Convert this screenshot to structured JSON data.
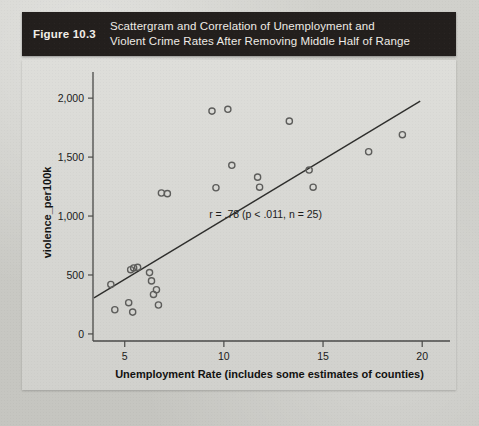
{
  "figure": {
    "number": "Figure 10.3",
    "title_line1": "Scattergram and Correlation of Unemployment and",
    "title_line2": "Violent Crime Rates After Removing Middle Half of Range",
    "bar_color": "#231f1d",
    "text_color": "#efece6"
  },
  "chart_data": {
    "type": "scatter",
    "title": "",
    "xlabel": "Unemployment Rate (includes some estimates of counties)",
    "ylabel": "violence_per100k",
    "xlim": [
      3.4,
      21.2
    ],
    "ylim": [
      -60,
      2120
    ],
    "xticks": [
      5,
      10,
      15,
      20
    ],
    "xticklabels": [
      "5",
      "10",
      "15",
      "20"
    ],
    "yticks": [
      0,
      500,
      1000,
      1500,
      2000
    ],
    "yticklabels": [
      "0",
      "500",
      "1,000",
      "1,500",
      "2,000"
    ],
    "grid": false,
    "legend": null,
    "marker": "open-circle",
    "marker_color": "#5d5d5b",
    "points": [
      {
        "x": 4.3,
        "y": 420
      },
      {
        "x": 4.5,
        "y": 205
      },
      {
        "x": 5.2,
        "y": 265
      },
      {
        "x": 5.4,
        "y": 185
      },
      {
        "x": 5.45,
        "y": 560
      },
      {
        "x": 5.65,
        "y": 565
      },
      {
        "x": 6.25,
        "y": 520
      },
      {
        "x": 6.35,
        "y": 450
      },
      {
        "x": 6.6,
        "y": 375
      },
      {
        "x": 6.7,
        "y": 245
      },
      {
        "x": 6.85,
        "y": 1195
      },
      {
        "x": 7.15,
        "y": 1190
      },
      {
        "x": 9.4,
        "y": 1890
      },
      {
        "x": 9.6,
        "y": 1240
      },
      {
        "x": 10.2,
        "y": 1905
      },
      {
        "x": 10.4,
        "y": 1430
      },
      {
        "x": 11.7,
        "y": 1330
      },
      {
        "x": 11.8,
        "y": 1245
      },
      {
        "x": 13.3,
        "y": 1805
      },
      {
        "x": 14.3,
        "y": 1390
      },
      {
        "x": 14.5,
        "y": 1245
      },
      {
        "x": 17.3,
        "y": 1545
      },
      {
        "x": 19.0,
        "y": 1690
      },
      {
        "x": 6.45,
        "y": 335
      },
      {
        "x": 5.3,
        "y": 545
      }
    ],
    "regression_line": {
      "x_start": 3.45,
      "y_start": 305,
      "x_end": 19.9,
      "y_end": 1975,
      "color": "#2e2e2c"
    },
    "annotation": {
      "text": "r = .78 (p < .011, n = 25)",
      "x": 12.1,
      "y": 980
    }
  }
}
